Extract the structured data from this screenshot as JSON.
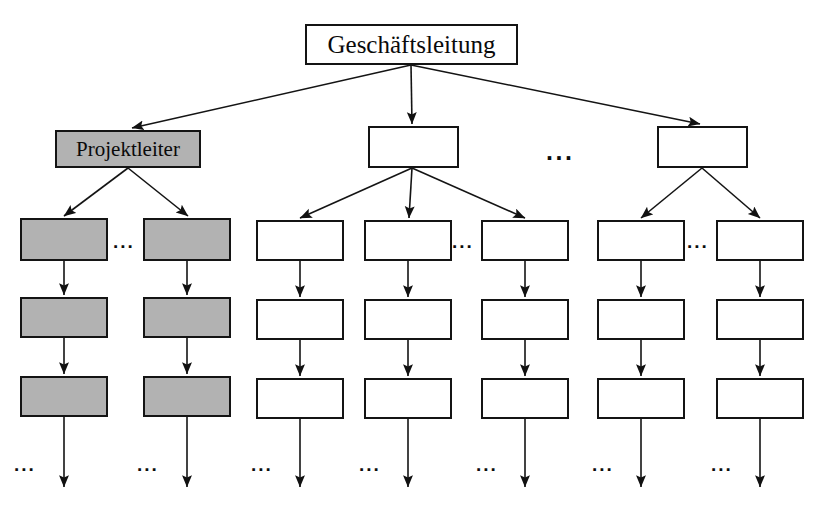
{
  "diagram": {
    "type": "organizational-hierarchy-tree",
    "title_text": "Geschäftsleitung",
    "highlight_label": "Projektleiter",
    "ellipsis_text": "...",
    "colors": {
      "shaded_fill": "#b2b2b2",
      "plain_fill": "#ffffff",
      "stroke": "#141414",
      "background": "#ffffff"
    },
    "levels": [
      {
        "name": "executive-level",
        "nodes": [
          {
            "id": "geschaeftsleitung",
            "label": "Geschäftsleitung",
            "shaded": false,
            "x": 305,
            "y": 24,
            "w": 213,
            "h": 41,
            "size": "titled"
          }
        ],
        "ellipses": []
      },
      {
        "name": "management-level",
        "nodes": [
          {
            "id": "projektleiter",
            "label": "Projektleiter",
            "shaded": true,
            "x": 55,
            "y": 130,
            "w": 146,
            "h": 38,
            "size": "lead"
          },
          {
            "id": "mgmt-2",
            "label": "",
            "shaded": false,
            "x": 368,
            "y": 126,
            "w": 91,
            "h": 42,
            "size": ""
          },
          {
            "id": "mgmt-3",
            "label": "",
            "shaded": false,
            "x": 657,
            "y": 126,
            "w": 91,
            "h": 42,
            "size": ""
          }
        ],
        "ellipses": [
          {
            "id": "ell-mgmt",
            "x": 546,
            "y": 139,
            "small": false
          }
        ]
      },
      {
        "name": "team-level-1",
        "nodes": [
          {
            "id": "r3c1",
            "label": "",
            "shaded": true,
            "x": 20,
            "y": 218,
            "w": 88,
            "h": 43,
            "size": ""
          },
          {
            "id": "r3c2",
            "label": "",
            "shaded": true,
            "x": 143,
            "y": 218,
            "w": 88,
            "h": 43,
            "size": ""
          },
          {
            "id": "r3c3",
            "label": "",
            "shaded": false,
            "x": 256,
            "y": 220,
            "w": 88,
            "h": 41,
            "size": ""
          },
          {
            "id": "r3c4",
            "label": "",
            "shaded": false,
            "x": 364,
            "y": 220,
            "w": 88,
            "h": 41,
            "size": ""
          },
          {
            "id": "r3c5",
            "label": "",
            "shaded": false,
            "x": 481,
            "y": 220,
            "w": 88,
            "h": 41,
            "size": ""
          },
          {
            "id": "r3c6",
            "label": "",
            "shaded": false,
            "x": 597,
            "y": 220,
            "w": 88,
            "h": 41,
            "size": ""
          },
          {
            "id": "r3c7",
            "label": "",
            "shaded": false,
            "x": 716,
            "y": 220,
            "w": 88,
            "h": 41,
            "size": ""
          }
        ],
        "ellipses": [
          {
            "id": "ell-r3-a",
            "x": 113,
            "y": 232,
            "small": true
          },
          {
            "id": "ell-r3-b",
            "x": 452,
            "y": 232,
            "small": true
          },
          {
            "id": "ell-r3-c",
            "x": 687,
            "y": 232,
            "small": true
          }
        ]
      },
      {
        "name": "team-level-2",
        "nodes": [
          {
            "id": "r4c1",
            "label": "",
            "shaded": true,
            "x": 20,
            "y": 297,
            "w": 88,
            "h": 41,
            "size": ""
          },
          {
            "id": "r4c2",
            "label": "",
            "shaded": true,
            "x": 143,
            "y": 297,
            "w": 88,
            "h": 41,
            "size": ""
          },
          {
            "id": "r4c3",
            "label": "",
            "shaded": false,
            "x": 256,
            "y": 299,
            "w": 88,
            "h": 41,
            "size": ""
          },
          {
            "id": "r4c4",
            "label": "",
            "shaded": false,
            "x": 364,
            "y": 299,
            "w": 88,
            "h": 41,
            "size": ""
          },
          {
            "id": "r4c5",
            "label": "",
            "shaded": false,
            "x": 481,
            "y": 299,
            "w": 88,
            "h": 41,
            "size": ""
          },
          {
            "id": "r4c6",
            "label": "",
            "shaded": false,
            "x": 597,
            "y": 299,
            "w": 88,
            "h": 41,
            "size": ""
          },
          {
            "id": "r4c7",
            "label": "",
            "shaded": false,
            "x": 716,
            "y": 299,
            "w": 88,
            "h": 41,
            "size": ""
          }
        ],
        "ellipses": []
      },
      {
        "name": "team-level-3",
        "nodes": [
          {
            "id": "r5c1",
            "label": "",
            "shaded": true,
            "x": 20,
            "y": 376,
            "w": 88,
            "h": 41,
            "size": ""
          },
          {
            "id": "r5c2",
            "label": "",
            "shaded": true,
            "x": 143,
            "y": 376,
            "w": 88,
            "h": 41,
            "size": ""
          },
          {
            "id": "r5c3",
            "label": "",
            "shaded": false,
            "x": 256,
            "y": 378,
            "w": 88,
            "h": 41,
            "size": ""
          },
          {
            "id": "r5c4",
            "label": "",
            "shaded": false,
            "x": 364,
            "y": 378,
            "w": 88,
            "h": 41,
            "size": ""
          },
          {
            "id": "r5c5",
            "label": "",
            "shaded": false,
            "x": 481,
            "y": 378,
            "w": 88,
            "h": 41,
            "size": ""
          },
          {
            "id": "r5c6",
            "label": "",
            "shaded": false,
            "x": 597,
            "y": 378,
            "w": 88,
            "h": 41,
            "size": ""
          },
          {
            "id": "r5c7",
            "label": "",
            "shaded": false,
            "x": 716,
            "y": 378,
            "w": 88,
            "h": 41,
            "size": ""
          }
        ],
        "ellipses": []
      },
      {
        "name": "continuation-level",
        "nodes": [],
        "ellipses": [
          {
            "id": "ell-tail-1",
            "x": 14,
            "y": 455,
            "small": true
          },
          {
            "id": "ell-tail-2",
            "x": 137,
            "y": 455,
            "small": true
          },
          {
            "id": "ell-tail-3",
            "x": 251,
            "y": 455,
            "small": true
          },
          {
            "id": "ell-tail-4",
            "x": 359,
            "y": 455,
            "small": true
          },
          {
            "id": "ell-tail-5",
            "x": 476,
            "y": 455,
            "small": true
          },
          {
            "id": "ell-tail-6",
            "x": 592,
            "y": 455,
            "small": true
          },
          {
            "id": "ell-tail-7",
            "x": 711,
            "y": 455,
            "small": true
          }
        ]
      }
    ],
    "edges": [
      {
        "id": "e-top-left",
        "from": "geschaeftsleitung",
        "to": "projektleiter",
        "x1": 411,
        "y1": 65,
        "x2": 132,
        "y2": 128
      },
      {
        "id": "e-top-mid",
        "from": "geschaeftsleitung",
        "to": "mgmt-2",
        "x1": 411,
        "y1": 65,
        "x2": 412,
        "y2": 124
      },
      {
        "id": "e-top-right",
        "from": "geschaeftsleitung",
        "to": "mgmt-3",
        "x1": 411,
        "y1": 65,
        "x2": 700,
        "y2": 124
      },
      {
        "id": "e-pl-1",
        "from": "projektleiter",
        "to": "r3c1",
        "x1": 128,
        "y1": 168,
        "x2": 64,
        "y2": 216
      },
      {
        "id": "e-pl-2",
        "from": "projektleiter",
        "to": "r3c2",
        "x1": 128,
        "y1": 168,
        "x2": 188,
        "y2": 216
      },
      {
        "id": "e-m2-1",
        "from": "mgmt-2",
        "to": "r3c3",
        "x1": 412,
        "y1": 168,
        "x2": 300,
        "y2": 218
      },
      {
        "id": "e-m2-2",
        "from": "mgmt-2",
        "to": "r3c4",
        "x1": 412,
        "y1": 168,
        "x2": 409,
        "y2": 218
      },
      {
        "id": "e-m2-3",
        "from": "mgmt-2",
        "to": "r3c5",
        "x1": 412,
        "y1": 168,
        "x2": 525,
        "y2": 218
      },
      {
        "id": "e-m3-1",
        "from": "mgmt-3",
        "to": "r3c6",
        "x1": 702,
        "y1": 168,
        "x2": 641,
        "y2": 218
      },
      {
        "id": "e-m3-2",
        "from": "mgmt-3",
        "to": "r3c7",
        "x1": 702,
        "y1": 168,
        "x2": 760,
        "y2": 218
      },
      {
        "id": "e-c1-34",
        "from": "r3c1",
        "to": "r4c1",
        "x1": 64,
        "y1": 261,
        "x2": 64,
        "y2": 295
      },
      {
        "id": "e-c2-34",
        "from": "r3c2",
        "to": "r4c2",
        "x1": 187,
        "y1": 261,
        "x2": 187,
        "y2": 295
      },
      {
        "id": "e-c3-34",
        "from": "r3c3",
        "to": "r4c3",
        "x1": 300,
        "y1": 261,
        "x2": 300,
        "y2": 297
      },
      {
        "id": "e-c4-34",
        "from": "r3c4",
        "to": "r4c4",
        "x1": 408,
        "y1": 261,
        "x2": 408,
        "y2": 297
      },
      {
        "id": "e-c5-34",
        "from": "r3c5",
        "to": "r4c5",
        "x1": 525,
        "y1": 261,
        "x2": 525,
        "y2": 297
      },
      {
        "id": "e-c6-34",
        "from": "r3c6",
        "to": "r4c6",
        "x1": 641,
        "y1": 261,
        "x2": 641,
        "y2": 297
      },
      {
        "id": "e-c7-34",
        "from": "r3c7",
        "to": "r4c7",
        "x1": 760,
        "y1": 261,
        "x2": 760,
        "y2": 297
      },
      {
        "id": "e-c1-45",
        "from": "r4c1",
        "to": "r5c1",
        "x1": 64,
        "y1": 338,
        "x2": 64,
        "y2": 374
      },
      {
        "id": "e-c2-45",
        "from": "r4c2",
        "to": "r5c2",
        "x1": 187,
        "y1": 338,
        "x2": 187,
        "y2": 374
      },
      {
        "id": "e-c3-45",
        "from": "r4c3",
        "to": "r5c3",
        "x1": 300,
        "y1": 340,
        "x2": 300,
        "y2": 376
      },
      {
        "id": "e-c4-45",
        "from": "r4c4",
        "to": "r5c4",
        "x1": 408,
        "y1": 340,
        "x2": 408,
        "y2": 376
      },
      {
        "id": "e-c5-45",
        "from": "r4c5",
        "to": "r5c5",
        "x1": 525,
        "y1": 340,
        "x2": 525,
        "y2": 376
      },
      {
        "id": "e-c6-45",
        "from": "r4c6",
        "to": "r5c6",
        "x1": 641,
        "y1": 340,
        "x2": 641,
        "y2": 376
      },
      {
        "id": "e-c7-45",
        "from": "r4c7",
        "to": "r5c7",
        "x1": 760,
        "y1": 340,
        "x2": 760,
        "y2": 376
      },
      {
        "id": "e-tail-1",
        "from": "r5c1",
        "to": "continuation-level",
        "x1": 64,
        "y1": 417,
        "x2": 64,
        "y2": 487
      },
      {
        "id": "e-tail-2",
        "from": "r5c2",
        "to": "continuation-level",
        "x1": 187,
        "y1": 417,
        "x2": 187,
        "y2": 487
      },
      {
        "id": "e-tail-3",
        "from": "r5c3",
        "to": "continuation-level",
        "x1": 300,
        "y1": 419,
        "x2": 300,
        "y2": 487
      },
      {
        "id": "e-tail-4",
        "from": "r5c4",
        "to": "continuation-level",
        "x1": 408,
        "y1": 419,
        "x2": 408,
        "y2": 487
      },
      {
        "id": "e-tail-5",
        "from": "r5c5",
        "to": "continuation-level",
        "x1": 525,
        "y1": 419,
        "x2": 525,
        "y2": 487
      },
      {
        "id": "e-tail-6",
        "from": "r5c6",
        "to": "continuation-level",
        "x1": 641,
        "y1": 419,
        "x2": 641,
        "y2": 487
      },
      {
        "id": "e-tail-7",
        "from": "r5c7",
        "to": "continuation-level",
        "x1": 760,
        "y1": 419,
        "x2": 760,
        "y2": 487
      }
    ]
  }
}
